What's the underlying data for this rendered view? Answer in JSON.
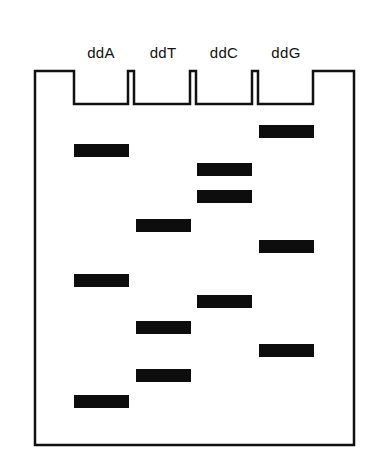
{
  "diagram": {
    "type": "sanger-sequencing-gel",
    "lanes": [
      {
        "label": "ddA",
        "center_x": 101,
        "bands": [
          150,
          280,
          401
        ]
      },
      {
        "label": "ddT",
        "center_x": 163,
        "bands": [
          225,
          327,
          375
        ]
      },
      {
        "label": "ddC",
        "center_x": 224,
        "bands": [
          169,
          196,
          301
        ]
      },
      {
        "label": "ddG",
        "center_x": 286,
        "bands": [
          131,
          246,
          350
        ]
      }
    ],
    "colors": {
      "outline": "#111111",
      "band": "#0d0d0d",
      "background": "#ffffff"
    }
  }
}
